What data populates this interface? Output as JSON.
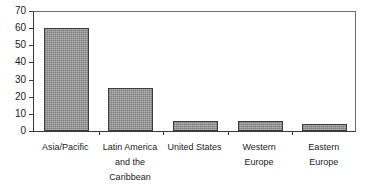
{
  "chart_data": {
    "type": "bar",
    "title": "",
    "subtitle": "",
    "xlabel": "",
    "ylabel": "",
    "categories": [
      "Asia/Pacific",
      "Latin America and the Caribbean",
      "United States",
      "Western Europe",
      "Eastern Europe"
    ],
    "category_lines": [
      [
        "Asia/Pacific"
      ],
      [
        "Latin America",
        "and the",
        "Caribbean"
      ],
      [
        "United States"
      ],
      [
        "Western",
        "Europe"
      ],
      [
        "Eastern",
        "Europe"
      ]
    ],
    "values": [
      60,
      25,
      6,
      6,
      4
    ],
    "ylim": [
      0,
      70
    ],
    "ytick_step": 10,
    "yticks": [
      0,
      10,
      20,
      30,
      40,
      50,
      60,
      70
    ],
    "ytick_labels": [
      "0",
      "10",
      "20",
      "30",
      "40",
      "50",
      "60",
      "70"
    ],
    "grid": false,
    "legend": null,
    "legend_position": "none",
    "bar_fill_color": "#8c8c8c",
    "bar_border_color": "#3d3d3d",
    "axis_color": "#3a3a3a",
    "frame_color": "#6b6b6b",
    "text_color": "#1a1a1a",
    "background_color": "#ffffff"
  }
}
